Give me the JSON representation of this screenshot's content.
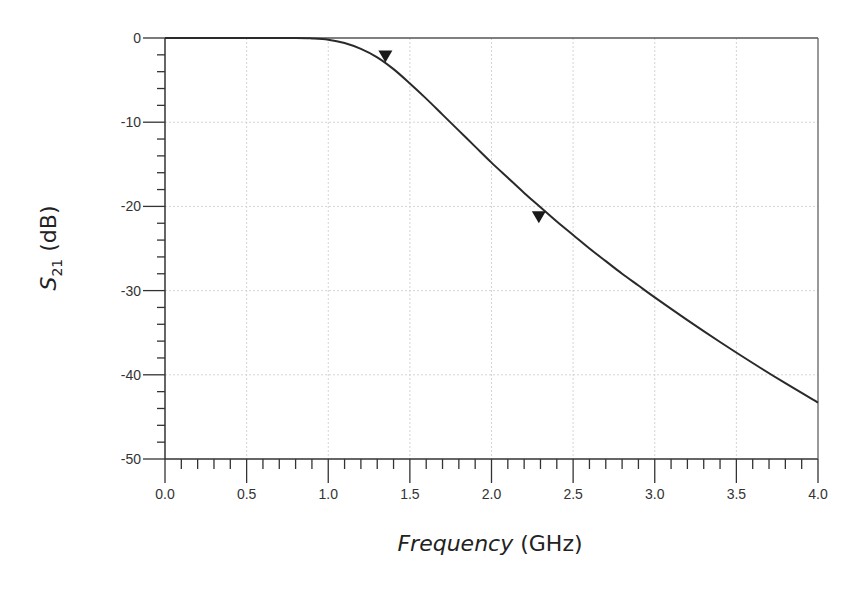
{
  "chart_data": {
    "type": "line",
    "title": "",
    "xlabel": "Frequency (GHz)",
    "xlabel_italic_part": "Frequency",
    "xlabel_unit_part": "(GHz)",
    "ylabel": "S21 (dB)",
    "ylabel_main": "S",
    "ylabel_sub": "21",
    "ylabel_unit": "(dB)",
    "xlim": [
      0.0,
      4.0
    ],
    "ylim": [
      -50,
      0
    ],
    "xticks": [
      "0.0",
      "0.5",
      "1.0",
      "1.5",
      "2.0",
      "2.5",
      "3.0",
      "3.5",
      "4.0"
    ],
    "yticks": [
      "0",
      "-10",
      "-20",
      "-30",
      "-40",
      "-50"
    ],
    "grid": true,
    "legend": null,
    "series": [
      {
        "name": "S21",
        "color": "#2a2a2a",
        "x": [
          0.0,
          0.5,
          0.8,
          0.9,
          1.0,
          1.1,
          1.2,
          1.3,
          1.4,
          1.5,
          1.6,
          1.7,
          1.8,
          1.9,
          2.0,
          2.1,
          2.2,
          2.3,
          2.4,
          2.5,
          2.6,
          2.7,
          2.8,
          2.9,
          3.0,
          3.2,
          3.4,
          3.6,
          3.8,
          4.0
        ],
        "values": [
          0.0,
          0.0,
          0.0,
          -0.05,
          -0.2,
          -0.6,
          -1.3,
          -2.3,
          -3.7,
          -5.4,
          -7.2,
          -9.1,
          -11.0,
          -12.9,
          -14.8,
          -16.6,
          -18.4,
          -20.1,
          -21.8,
          -23.4,
          -25.0,
          -26.5,
          -28.0,
          -29.4,
          -30.8,
          -33.5,
          -36.1,
          -38.6,
          -41.0,
          -43.3
        ]
      }
    ],
    "markers": [
      {
        "name": "m1",
        "x": 1.35,
        "y": -2.9,
        "shape": "down-triangle"
      },
      {
        "name": "m2",
        "x": 2.29,
        "y": -22.0,
        "shape": "down-triangle"
      }
    ]
  }
}
